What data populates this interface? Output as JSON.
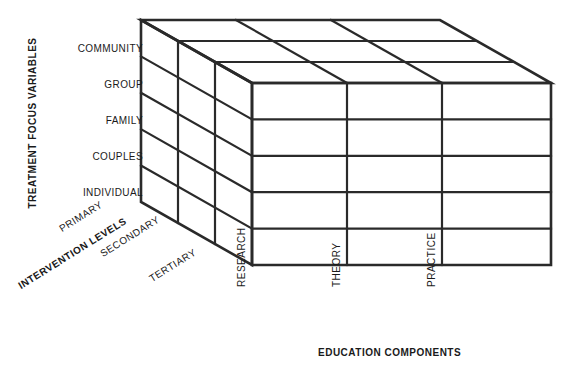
{
  "diagram": {
    "type": "3d-cube-matrix",
    "dimensions": {
      "rows": 5,
      "columns": 3,
      "depth_layers": 3
    },
    "colors": {
      "line": "#2a2a2a",
      "face": "#ffffff",
      "text": "#1a1a1a",
      "background": "#ffffff"
    }
  },
  "axes": {
    "vertical": {
      "title": "TREATMENT FOCUS VARIABLES",
      "orientation": "rotated-90-ccw",
      "labels": [
        "COMMUNITY",
        "GROUP",
        "FAMILY",
        "COUPLES",
        "INDIVIDUAL"
      ]
    },
    "depth": {
      "title": "INTERVENTION LEVELS",
      "orientation": "rotated-32-ccw",
      "labels": [
        "PRIMARY",
        "SECONDARY",
        "TERTIARY"
      ]
    },
    "horizontal": {
      "title": "EDUCATION COMPONENTS",
      "orientation": "horizontal",
      "labels": [
        "RESEARCH",
        "THEORY",
        "PRACTICE"
      ]
    }
  }
}
